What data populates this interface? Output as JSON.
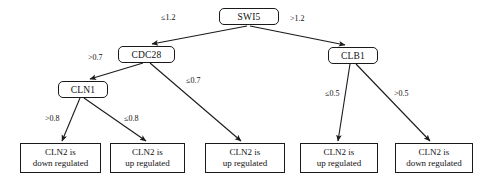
{
  "diagram": {
    "type": "decision-tree",
    "colors": {
      "stroke": "#1a1a1a",
      "background": "#ffffff",
      "text": "#111111"
    },
    "nodes": {
      "root": {
        "id": "swi5",
        "label": "SWI5",
        "kind": "internal"
      },
      "cdc28": {
        "id": "cdc28",
        "label": "CDC28",
        "kind": "internal"
      },
      "clb1": {
        "id": "clb1",
        "label": "CLB1",
        "kind": "internal"
      },
      "cln1": {
        "id": "cln1",
        "label": "CLN1",
        "kind": "internal"
      },
      "leaf1": {
        "id": "leaf-1",
        "label": "CLN2 is\ndown regulated",
        "kind": "leaf"
      },
      "leaf2": {
        "id": "leaf-2",
        "label": "CLN2 is\nup regulated",
        "kind": "leaf"
      },
      "leaf3": {
        "id": "leaf-3",
        "label": "CLN2 is\nup regulated",
        "kind": "leaf"
      },
      "leaf4": {
        "id": "leaf-4",
        "label": "CLN2 is\nup regulated",
        "kind": "leaf"
      },
      "leaf5": {
        "id": "leaf-5",
        "label": "CLN2 is\ndown regulated",
        "kind": "leaf"
      }
    },
    "edge_labels": {
      "swi5_left": "≤1.2",
      "swi5_right": ">1.2",
      "cdc28_left": ">0.7",
      "cdc28_right": "≤0.7",
      "cln1_left": ">0.8",
      "cln1_right": "≤0.8",
      "clb1_left": "≤0.5",
      "clb1_right": ">0.5"
    },
    "edges": [
      {
        "from": "SWI5",
        "to": "CDC28",
        "label": "≤1.2"
      },
      {
        "from": "SWI5",
        "to": "CLB1",
        "label": ">1.2"
      },
      {
        "from": "CDC28",
        "to": "CLN1",
        "label": ">0.7"
      },
      {
        "from": "CDC28",
        "to": "CLN2 is up regulated",
        "label": "≤0.7"
      },
      {
        "from": "CLN1",
        "to": "CLN2 is down regulated",
        "label": ">0.8"
      },
      {
        "from": "CLN1",
        "to": "CLN2 is up regulated",
        "label": "≤0.8"
      },
      {
        "from": "CLB1",
        "to": "CLN2 is up regulated",
        "label": "≤0.5"
      },
      {
        "from": "CLB1",
        "to": "CLN2 is down regulated",
        "label": ">0.5"
      }
    ]
  }
}
